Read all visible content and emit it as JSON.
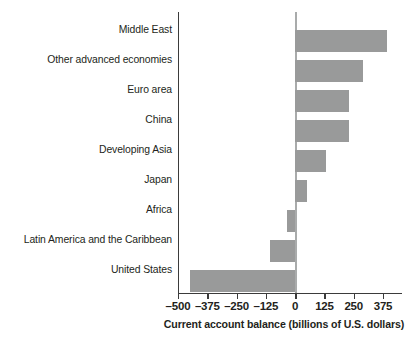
{
  "chart_data": {
    "type": "bar",
    "orientation": "horizontal",
    "title": "",
    "xlabel": "Current account balance (billions of U.S. dollars)",
    "ylabel": "",
    "categories": [
      "Middle East",
      "Other advanced economies",
      "Euro area",
      "China",
      "Developing Asia",
      "Japan",
      "Africa",
      "Latin America and the Caribbean",
      "United States"
    ],
    "values": [
      390,
      290,
      232,
      232,
      133,
      52,
      -35,
      -108,
      -450
    ],
    "xlim": [
      -500,
      400
    ],
    "xticks": [
      -500,
      -375,
      -250,
      -125,
      0,
      125,
      250,
      375
    ],
    "xticklabels": [
      "–500",
      "–375",
      "–250",
      "–125",
      "0",
      "125",
      "250",
      "375"
    ],
    "grid": false,
    "legend": null,
    "bar_color": "#999a9a",
    "axis_color": "#3b3b3b",
    "zero_line_color": "#a9abab"
  }
}
